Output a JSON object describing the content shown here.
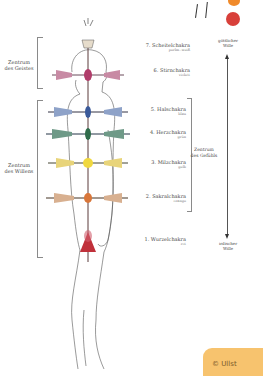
{
  "groups": {
    "spirit": "Zentrum\ndes Geistes",
    "will": "Zentrum\ndes Willens",
    "feeling": "Zentrum\ndes Gefühls"
  },
  "axis": {
    "top": "göttlicher\nWille",
    "bottom": "irdischer\nWille"
  },
  "chakras": [
    {
      "name": "7. Scheitelchakra",
      "color_label": "perlm.-weiß",
      "color": "#d9d0c0"
    },
    {
      "name": "6. Stirnchakra",
      "color_label": "violett",
      "color": "#b03c6a"
    },
    {
      "name": "5. Halschakra",
      "color_label": "blau",
      "color": "#3b5a9a"
    },
    {
      "name": "4. Herzchakra",
      "color_label": "grün",
      "color": "#2f6b4a"
    },
    {
      "name": "3. Milzchakra",
      "color_label": "gelb",
      "color": "#e8c830"
    },
    {
      "name": "2. Sakralchakra",
      "color_label": "orange",
      "color": "#d8763a"
    },
    {
      "name": "1. Wurzelchakra",
      "color_label": "rot",
      "color": "#c0303a"
    }
  ],
  "copyright": "© Ullst"
}
